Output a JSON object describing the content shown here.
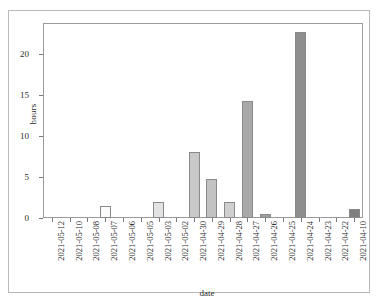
{
  "chart_data": {
    "type": "bar",
    "title": "",
    "xlabel": "date",
    "ylabel": "hours",
    "ylim": [
      0,
      23.8
    ],
    "yticks": [
      0,
      5,
      10,
      15,
      20
    ],
    "grid": false,
    "legend": null,
    "categories": [
      "2021-05-12",
      "2021-05-10",
      "2021-05-08",
      "2021-05-07",
      "2021-05-06",
      "2021-05-05",
      "2021-05-03",
      "2021-05-02",
      "2021-04-30",
      "2021-04-29",
      "2021-04-28",
      "2021-04-27",
      "2021-04-26",
      "2021-04-25",
      "2021-04-24",
      "2021-04-23",
      "2021-04-22",
      "2021-04-10"
    ],
    "values": [
      0,
      0,
      0,
      1.5,
      0,
      0,
      2.0,
      0,
      8.1,
      4.8,
      2.0,
      14.3,
      0.5,
      0,
      22.7,
      0,
      0,
      1.1
    ],
    "bar_colors": [
      "#ffffff",
      "#ffffff",
      "#ffffff",
      "#fbfbfb",
      "#ffffff",
      "#ffffff",
      "#e3e3e3",
      "#ffffff",
      "#c9c9c9",
      "#c2c2c2",
      "#cfcfcf",
      "#a9a9a9",
      "#9d9d9d",
      "#ffffff",
      "#8e8e8e",
      "#ffffff",
      "#ffffff",
      "#7f7f7f"
    ],
    "bar_edge_color": "#8a8a8a"
  },
  "axis": {
    "y_tick_labels": [
      "0",
      "5",
      "10",
      "15",
      "20"
    ],
    "x_axis_title": "date",
    "y_axis_title": "hours"
  },
  "colors": {
    "panel_border": "#9b9b9b",
    "frame_border": "#b9b9b9",
    "tick": "#7a7a7a",
    "text": "#2b2b2b",
    "background": "#ffffff"
  }
}
